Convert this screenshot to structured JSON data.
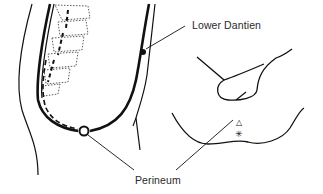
{
  "diagram": {
    "type": "anatomical line drawing",
    "labels": {
      "lower_dantien": "Lower Dantien",
      "perineum": "Perineum"
    },
    "points": [
      {
        "name": "Lower Dantien",
        "marker": "filled dot",
        "x": 143,
        "y": 52
      },
      {
        "name": "Perineum",
        "marker": "hollow circle",
        "x": 84,
        "y": 131
      }
    ],
    "inset_symbols": [
      {
        "name": "triangle",
        "glyph": "△"
      },
      {
        "name": "asterisk",
        "glyph": "✳"
      }
    ],
    "colors": {
      "line": "#1a1a1a",
      "background": "#ffffff"
    }
  }
}
